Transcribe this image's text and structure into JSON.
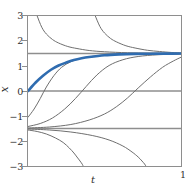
{
  "figure": {
    "background_color": "#ffffff",
    "frame_color": "#8e8e8e",
    "tick_label_color": "#2f2f2f"
  },
  "axes": {
    "x_label": "t",
    "y_label": "x",
    "x_ticks": [
      {
        "value": 1,
        "label": "1"
      }
    ],
    "y_ticks": [
      {
        "value": 3,
        "label": "3"
      },
      {
        "value": 2,
        "label": "2"
      },
      {
        "value": 1,
        "label": "1"
      },
      {
        "value": 0,
        "label": "0"
      },
      {
        "value": -1,
        "label": "−1"
      },
      {
        "value": -2,
        "label": "−2"
      },
      {
        "value": -3,
        "label": "−3"
      }
    ]
  },
  "chart_data": {
    "type": "line",
    "title": "",
    "xlabel": "t",
    "ylabel": "x",
    "xlim": [
      0,
      1
    ],
    "ylim": [
      -3,
      3
    ],
    "grid": false,
    "legend": "none",
    "x_tick_labels": [
      "1"
    ],
    "y_tick_labels": [
      "3",
      "2",
      "1",
      "0",
      "−1",
      "−2",
      "−3"
    ],
    "equilibria": [
      {
        "value": 1.5,
        "stability": "stable",
        "color": "#8e8e8e",
        "label": "x = 1.5"
      },
      {
        "value": -1.5,
        "stability": "unstable",
        "color": "#8e8e8e",
        "label": "x = -1.5"
      }
    ],
    "reference_lines": [
      {
        "y": 0,
        "color": "#8e8e8e",
        "label": "x = 0"
      }
    ],
    "highlight_color": "#2f6cb0",
    "curve_color": "#6f6f6f",
    "series": [
      {
        "name": "highlighted-solution",
        "color": "#2f6cb0",
        "highlight": true,
        "initial_value": 0,
        "asymptote": 1.5,
        "x": [
          0.0,
          0.05,
          0.1,
          0.15,
          0.2,
          0.25,
          0.3,
          0.35,
          0.4,
          0.5,
          0.6,
          0.7,
          0.8,
          0.9,
          1.0
        ],
        "y": [
          0.0,
          0.34,
          0.62,
          0.85,
          1.02,
          1.14,
          1.24,
          1.31,
          1.36,
          1.43,
          1.465,
          1.483,
          1.491,
          1.496,
          1.498
        ]
      },
      {
        "name": "solution-upper-asymptote-1",
        "color": "#6f6f6f",
        "highlight": false,
        "asymptote": 1.5,
        "x": [
          0.06,
          0.09,
          0.12,
          0.16,
          0.2,
          0.26,
          0.32,
          0.4,
          0.5,
          0.65,
          0.8,
          1.0
        ],
        "y": [
          3.0,
          2.55,
          2.28,
          2.06,
          1.92,
          1.78,
          1.7,
          1.62,
          1.57,
          1.53,
          1.515,
          1.505
        ]
      },
      {
        "name": "solution-upper-asymptote-2",
        "color": "#6f6f6f",
        "highlight": false,
        "asymptote": 1.5,
        "x": [
          0.44,
          0.47,
          0.5,
          0.54,
          0.58,
          0.64,
          0.7,
          0.78,
          0.86,
          0.94,
          1.0
        ],
        "y": [
          3.0,
          2.58,
          2.32,
          2.1,
          1.96,
          1.81,
          1.72,
          1.63,
          1.58,
          1.54,
          1.52
        ]
      },
      {
        "name": "solution-from-minus-one-a",
        "color": "#6f6f6f",
        "highlight": false,
        "initial_value": -1.05,
        "asymptote": 1.5,
        "x": [
          0.0,
          0.04,
          0.08,
          0.12,
          0.17,
          0.22,
          0.28,
          0.35,
          0.45,
          0.55,
          0.7,
          0.85,
          1.0
        ],
        "y": [
          -1.05,
          -0.72,
          -0.3,
          0.16,
          0.62,
          0.95,
          1.17,
          1.31,
          1.41,
          1.455,
          1.48,
          1.49,
          1.495
        ]
      },
      {
        "name": "solution-from-minus-one-b",
        "color": "#6f6f6f",
        "highlight": false,
        "initial_value": -1.42,
        "asymptote": 1.5,
        "x": [
          0.0,
          0.08,
          0.16,
          0.24,
          0.31,
          0.38,
          0.45,
          0.53,
          0.62,
          0.72,
          0.85,
          1.0
        ],
        "y": [
          -1.42,
          -1.3,
          -1.08,
          -0.72,
          -0.3,
          0.18,
          0.64,
          1.02,
          1.25,
          1.38,
          1.45,
          1.48
        ]
      },
      {
        "name": "solution-from-minus-one-c",
        "color": "#6f6f6f",
        "highlight": false,
        "initial_value": -1.48,
        "asymptote": 1.5,
        "x": [
          0.0,
          0.14,
          0.28,
          0.4,
          0.5,
          0.58,
          0.65,
          0.72,
          0.8,
          0.88,
          0.95,
          1.0
        ],
        "y": [
          -1.48,
          -1.44,
          -1.34,
          -1.16,
          -0.92,
          -0.62,
          -0.28,
          0.12,
          0.56,
          0.95,
          1.2,
          1.35
        ]
      },
      {
        "name": "solution-diverging-down-1",
        "color": "#6f6f6f",
        "highlight": false,
        "vertical_asymptote": 0.36,
        "x": [
          0.0,
          0.06,
          0.12,
          0.18,
          0.23,
          0.27,
          0.3,
          0.32,
          0.34,
          0.355,
          0.36
        ],
        "y": [
          -1.56,
          -1.62,
          -1.72,
          -1.88,
          -2.06,
          -2.28,
          -2.48,
          -2.64,
          -2.8,
          -2.93,
          -3.0
        ]
      },
      {
        "name": "solution-diverging-down-2",
        "color": "#6f6f6f",
        "highlight": false,
        "vertical_asymptote": 0.77,
        "x": [
          0.0,
          0.14,
          0.28,
          0.42,
          0.53,
          0.62,
          0.68,
          0.72,
          0.745,
          0.762,
          0.77
        ],
        "y": [
          -1.52,
          -1.56,
          -1.64,
          -1.78,
          -1.96,
          -2.2,
          -2.44,
          -2.64,
          -2.8,
          -2.92,
          -3.0
        ]
      }
    ]
  }
}
